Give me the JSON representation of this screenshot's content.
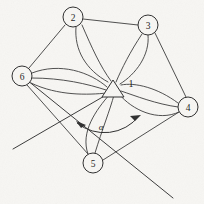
{
  "figure": {
    "background_color": "#f7f6f3",
    "stroke_color": "#2e2e2e"
  },
  "graph": {
    "nodes": [
      {
        "id": "1",
        "label": "1",
        "shape": "triangle",
        "x": 113,
        "y": 91,
        "r": 11,
        "label_x": 131,
        "label_y": 83
      },
      {
        "id": "2",
        "label": "2",
        "shape": "circle",
        "x": 73,
        "y": 17,
        "r": 10
      },
      {
        "id": "3",
        "label": "3",
        "shape": "circle",
        "x": 148,
        "y": 25,
        "r": 10
      },
      {
        "id": "4",
        "label": "4",
        "shape": "circle",
        "x": 188,
        "y": 107,
        "r": 10
      },
      {
        "id": "5",
        "label": "5",
        "shape": "circle",
        "x": 93,
        "y": 163,
        "r": 10
      },
      {
        "id": "6",
        "label": "6",
        "shape": "circle",
        "x": 22,
        "y": 76,
        "r": 10
      }
    ],
    "edges": [
      {
        "from": "2",
        "to": "3",
        "multiplicity": 1
      },
      {
        "from": "2",
        "to": "6",
        "multiplicity": 1
      },
      {
        "from": "3",
        "to": "4",
        "multiplicity": 1
      },
      {
        "from": "6",
        "to": "5",
        "multiplicity": 1
      },
      {
        "from": "5",
        "to": "4",
        "multiplicity": 1
      },
      {
        "from": "1",
        "to": "2",
        "multiplicity": 2
      },
      {
        "from": "1",
        "to": "3",
        "multiplicity": 2
      },
      {
        "from": "1",
        "to": "4",
        "multiplicity": 3
      },
      {
        "from": "1",
        "to": "5",
        "multiplicity": 2
      },
      {
        "from": "1",
        "to": "6",
        "multiplicity": 3
      }
    ],
    "rays": [
      {
        "name": "ray-southwest",
        "from_x": 113,
        "from_y": 91,
        "to_x": 13,
        "to_y": 149
      },
      {
        "name": "ray-southeast",
        "from_x": 22,
        "from_y": 76,
        "to_x": 173,
        "to_y": 198
      }
    ]
  },
  "annotation": {
    "angle_label": "α",
    "angle_label_x": 101,
    "angle_label_y": 127,
    "arc_radius": 46,
    "arc_start_deg": 210,
    "arc_end_deg": 305,
    "arrowheads": 2
  }
}
